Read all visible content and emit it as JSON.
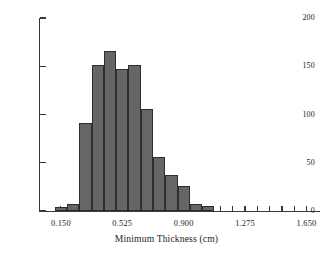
{
  "chart_data": {
    "type": "bar",
    "title": "",
    "xlabel": "Minimum Thickness (cm)",
    "ylabel": "",
    "xlim": [
      0.0225,
      1.7325
    ],
    "ylim": [
      0,
      200
    ],
    "grid": false,
    "legend": null,
    "bin_width": 0.075,
    "bin_edges": [
      0.1125,
      0.1875,
      0.2625,
      0.3375,
      0.4125,
      0.4875,
      0.5625,
      0.6375,
      0.7125,
      0.7875,
      0.8625,
      0.9375,
      1.0125,
      1.0875
    ],
    "bin_centers": [
      0.15,
      0.225,
      0.3,
      0.375,
      0.45,
      0.525,
      0.6,
      0.675,
      0.75,
      0.825,
      0.9,
      0.975,
      1.05
    ],
    "values": [
      4,
      7,
      91,
      151,
      166,
      147,
      151,
      106,
      56,
      37,
      26,
      7,
      5
    ],
    "categories": [
      "0.1125-0.1875",
      "0.1875-0.2625",
      "0.2625-0.3375",
      "0.3375-0.4125",
      "0.4125-0.4875",
      "0.4875-0.5625",
      "0.5625-0.6375",
      "0.6375-0.7125",
      "0.7125-0.7875",
      "0.7875-0.8625",
      "0.8625-0.9375",
      "0.9375-1.0125",
      "1.0125-1.0875"
    ],
    "y_ticks": [
      0,
      50,
      100,
      150,
      200
    ],
    "y_tick_labels": [
      "0",
      "50",
      "100",
      "150",
      "200"
    ],
    "x_ticks": [
      0.15,
      0.225,
      0.3,
      0.375,
      0.45,
      0.525,
      0.6,
      0.675,
      0.75,
      0.825,
      0.9,
      0.975,
      1.05,
      1.125,
      1.2,
      1.275,
      1.35,
      1.425,
      1.5,
      1.575,
      1.65
    ],
    "x_major_ticks": [
      0.15,
      0.525,
      0.9,
      1.275,
      1.65
    ],
    "x_major_tick_labels": [
      "0.150",
      "0.525",
      "0.900",
      "1.275",
      "1.650"
    ],
    "bar_color": "#666666",
    "bar_edge_color": "#2e2e2e",
    "axis_color": "#3a3a3a",
    "text_color": "#1c1c1c",
    "background": "#ffffff"
  }
}
